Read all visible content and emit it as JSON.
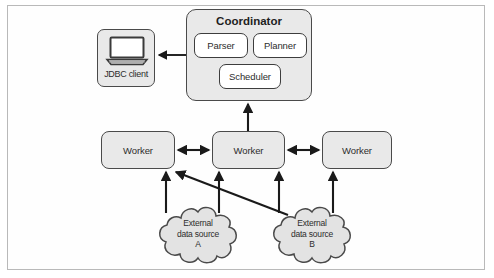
{
  "figure": {
    "kind": "architecture-diagram",
    "border_color": "#b9b9b9",
    "node_fill": "#e9e9e9",
    "node_stroke": "#4a4a4a",
    "sub_node_fill": "#ffffff",
    "arrow_color": "#1a1a1a"
  },
  "coordinator": {
    "title": "Coordinator",
    "components": [
      {
        "label": "Parser"
      },
      {
        "label": "Planner"
      },
      {
        "label": "Scheduler"
      }
    ]
  },
  "client": {
    "label": "JDBC client",
    "icon": "laptop-icon"
  },
  "workers": [
    {
      "label": "Worker"
    },
    {
      "label": "Worker"
    },
    {
      "label": "Worker"
    }
  ],
  "data_sources": [
    {
      "line1": "External",
      "line2": "data source",
      "line3": "A"
    },
    {
      "line1": "External",
      "line2": "data source",
      "line3": "B"
    }
  ],
  "connections": [
    {
      "from": "coordinator",
      "to": "jdbc-client",
      "style": "single-arrow-left"
    },
    {
      "from": "worker-center",
      "to": "coordinator",
      "style": "single-arrow-up"
    },
    {
      "from": "worker-left",
      "to": "worker-center",
      "style": "double-arrow-horizontal"
    },
    {
      "from": "worker-center",
      "to": "worker-right",
      "style": "double-arrow-horizontal"
    },
    {
      "from": "external-data-source-a",
      "to": "worker-left",
      "style": "single-arrow-up"
    },
    {
      "from": "external-data-source-a",
      "to": "worker-center",
      "style": "single-arrow-up"
    },
    {
      "from": "external-data-source-b",
      "to": "worker-left",
      "style": "single-arrow-diagonal"
    },
    {
      "from": "external-data-source-b",
      "to": "worker-center",
      "style": "single-arrow-up"
    },
    {
      "from": "external-data-source-b",
      "to": "worker-right",
      "style": "single-arrow-up"
    }
  ]
}
